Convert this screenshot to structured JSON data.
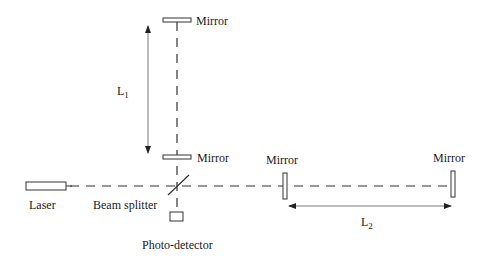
{
  "diagram": {
    "type": "Michelson interferometer schematic",
    "components": {
      "laser": "Laser",
      "beam_splitter": "Beam splitter",
      "photo_detector": "Photo-detector",
      "mirror_top": "Mirror",
      "mirror_mid": "Mirror",
      "mirror_right_near": "Mirror",
      "mirror_right_far": "Mirror"
    },
    "dimensions": {
      "l1": {
        "base": "L",
        "sub": "1"
      },
      "l2": {
        "base": "L",
        "sub": "2"
      }
    },
    "colors": {
      "line": "#333333",
      "text": "#1a1a1a",
      "background": "#ffffff"
    }
  }
}
